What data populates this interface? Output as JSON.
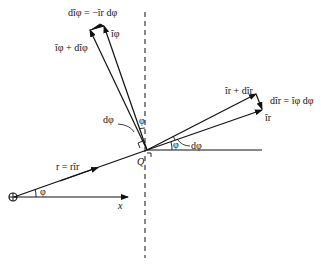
{
  "diagram": {
    "labels": {
      "d_iphi": "dîφ = −îr dφ",
      "iphi": "îφ",
      "iphi_plus": "îφ + dîφ",
      "ir_plus": "îr + dîr",
      "d_ir": "dîr = îφ dφ",
      "ir": "îr",
      "dphi_upper": "dφ",
      "phi_upper": "φ",
      "dphi_right": "dφ",
      "phi_right": "φ",
      "point_Q": "Q",
      "r_vector": "r = rîr",
      "phi_origin": "φ",
      "x_axis": "x"
    },
    "caption": "",
    "colors": {
      "line": "#111111",
      "background": "#ffffff"
    }
  }
}
